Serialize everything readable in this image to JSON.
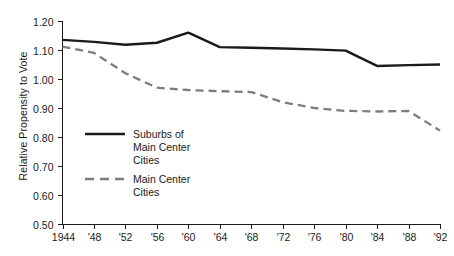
{
  "chart_data": {
    "type": "line",
    "title": "",
    "xlabel": "",
    "ylabel": "Relative Propensity to Vote",
    "ylim": [
      0.5,
      1.2
    ],
    "ytick_values": [
      0.5,
      0.6,
      0.7,
      0.8,
      0.9,
      1.0,
      1.1,
      1.2
    ],
    "ytick_labels": [
      "0.50",
      "0.60",
      "0.70",
      "0.80",
      "0.90",
      "1.00",
      "1.10",
      "1.20"
    ],
    "grid": false,
    "legend_position": "inside-left-lower",
    "x": [
      1944,
      1948,
      1952,
      1956,
      1960,
      1964,
      1968,
      1972,
      1976,
      1980,
      1984,
      1988,
      1992
    ],
    "xtick_labels": [
      "1944",
      "'48",
      "'52",
      "'56",
      "'60",
      "'64",
      "'68",
      "'72",
      "'76",
      "'80",
      "'84",
      "'88",
      "'92"
    ],
    "series": [
      {
        "name": "Suburbs of Main Center Cities",
        "style": "solid",
        "color": "#1a1a1a",
        "values": [
          1.135,
          1.128,
          1.118,
          1.125,
          1.16,
          1.11,
          1.108,
          1.105,
          1.102,
          1.098,
          1.045,
          1.048,
          1.05
        ]
      },
      {
        "name": "Main Center Cities",
        "style": "dashed",
        "color": "#7d7d7d",
        "values": [
          1.112,
          1.09,
          1.02,
          0.97,
          0.962,
          0.958,
          0.955,
          0.92,
          0.9,
          0.89,
          0.888,
          0.89,
          0.822
        ]
      }
    ]
  },
  "legend": {
    "entries": [
      {
        "label_line1": "Suburbs of",
        "label_line2": "Main Center",
        "label_line3": "Cities",
        "style": "solid"
      },
      {
        "label_line1": "Main Center",
        "label_line2": "Cities",
        "label_line3": "",
        "style": "dashed"
      }
    ]
  },
  "colors": {
    "series_solid": "#1a1a1a",
    "series_dashed": "#7d7d7d",
    "axis": "#1a1a1a",
    "background": "#ffffff"
  }
}
